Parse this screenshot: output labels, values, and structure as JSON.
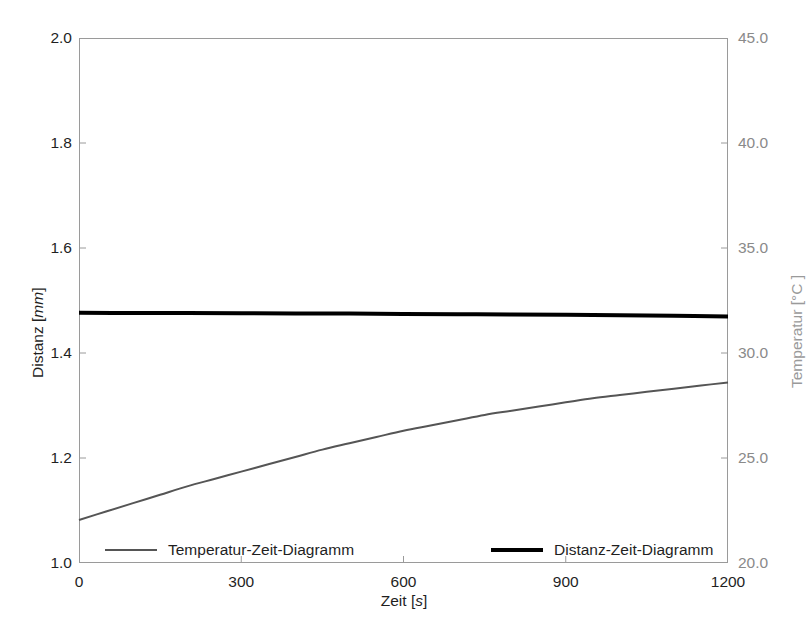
{
  "figure": {
    "background_color": "#ffffff",
    "frame_color": "#9a9a9a"
  },
  "axes": {
    "left": {
      "title_prefix": "Distanz [",
      "title_unit": "mm",
      "title_suffix": "]",
      "title": "Distanz [mm]",
      "ticks": [
        "1.0",
        "1.2",
        "1.4",
        "1.6",
        "1.8",
        "2.0"
      ],
      "color": "#1f1f1f"
    },
    "right": {
      "title": "Temperatur [°C ]",
      "ticks": [
        "20.0",
        "25.0",
        "30.0",
        "35.0",
        "40.0",
        "45.0"
      ],
      "color": "#8a8a8a"
    },
    "bottom": {
      "title_prefix": "Zeit [",
      "title_unit": "s",
      "title_suffix": "]",
      "title": "Zeit [s]",
      "ticks": [
        "0",
        "300",
        "600",
        "900",
        "1200"
      ],
      "color": "#1f1f1f"
    }
  },
  "legend": {
    "entries": [
      {
        "label": "Temperatur-Zeit-Diagramm",
        "color": "#555555",
        "width": 2
      },
      {
        "label": "Distanz-Zeit-Diagramm",
        "color": "#000000",
        "width": 4
      }
    ]
  },
  "chart_data": {
    "type": "line",
    "title": "",
    "subtitle": "",
    "xlabel": "Zeit [s]",
    "ylabel": "Distanz [mm]",
    "ylabel_secondary": "Temperatur [°C ]",
    "xlim": [
      0,
      1200
    ],
    "ylim": [
      1.0,
      2.0
    ],
    "ylim_secondary": [
      20.0,
      45.0
    ],
    "xticks": [
      0,
      300,
      600,
      900,
      1200
    ],
    "yticks": [
      1.0,
      1.2,
      1.4,
      1.6,
      1.8,
      2.0
    ],
    "yticks_secondary": [
      20.0,
      25.0,
      30.0,
      35.0,
      40.0,
      45.0
    ],
    "grid": false,
    "legend_position": "bottom-inside",
    "series": [
      {
        "name": "Temperatur-Zeit-Diagramm",
        "axis": "secondary",
        "units": "°C",
        "color": "#555555",
        "linewidth": 2,
        "x": [
          0,
          50,
          100,
          150,
          200,
          250,
          300,
          350,
          400,
          450,
          500,
          550,
          600,
          650,
          700,
          750,
          800,
          850,
          900,
          950,
          1000,
          1050,
          1100,
          1150,
          1200
        ],
        "y": [
          22.05,
          22.45,
          22.85,
          23.25,
          23.65,
          24.0,
          24.35,
          24.7,
          25.05,
          25.4,
          25.7,
          26.0,
          26.3,
          26.55,
          26.8,
          27.05,
          27.25,
          27.45,
          27.65,
          27.85,
          28.0,
          28.15,
          28.3,
          28.45,
          28.6
        ]
      },
      {
        "name": "Distanz-Zeit-Diagramm",
        "axis": "primary",
        "units": "mm",
        "color": "#000000",
        "linewidth": 4,
        "x": [
          0,
          100,
          200,
          300,
          400,
          500,
          600,
          700,
          800,
          900,
          1000,
          1100,
          1200
        ],
        "y": [
          1.4765,
          1.4762,
          1.476,
          1.4757,
          1.4753,
          1.475,
          1.4745,
          1.474,
          1.4735,
          1.4727,
          1.472,
          1.471,
          1.4695
        ]
      }
    ]
  }
}
